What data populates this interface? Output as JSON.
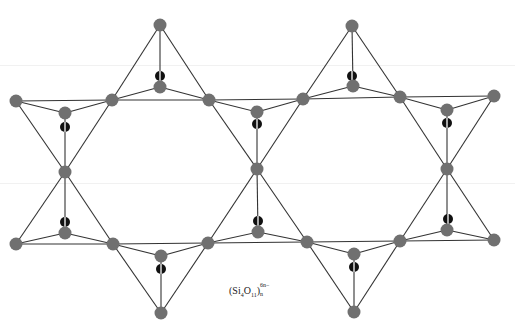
{
  "figure": {
    "caption": {
      "open": "(Si",
      "si_sub": "4",
      "o": "O",
      "o_sub": "11",
      "close": ")",
      "charge_sup": "6n−",
      "n_sub": "n"
    },
    "colors": {
      "oxygen": "#707070",
      "silicon": "#111111",
      "bond": "#333333",
      "background": "#ffffff"
    },
    "atom_radius": {
      "oxygen": 6.5,
      "silicon": 5
    },
    "oxygen_atoms": [
      [
        160,
        25
      ],
      [
        352,
        26
      ],
      [
        16,
        101
      ],
      [
        112,
        100
      ],
      [
        209,
        100
      ],
      [
        303,
        99
      ],
      [
        400,
        97
      ],
      [
        494,
        96
      ],
      [
        65,
        113
      ],
      [
        160,
        87
      ],
      [
        257,
        112
      ],
      [
        353,
        86
      ],
      [
        447,
        110
      ],
      [
        65,
        172
      ],
      [
        257,
        169
      ],
      [
        447,
        169
      ],
      [
        65,
        233
      ],
      [
        258,
        232
      ],
      [
        447,
        230
      ],
      [
        161,
        256
      ],
      [
        354,
        254
      ],
      [
        16,
        244
      ],
      [
        113,
        244
      ],
      [
        208,
        243
      ],
      [
        307,
        242
      ],
      [
        400,
        241
      ],
      [
        494,
        240
      ],
      [
        161,
        313
      ],
      [
        354,
        312
      ]
    ],
    "silicon_atoms": [
      [
        160,
        76
      ],
      [
        352,
        76
      ],
      [
        65,
        127
      ],
      [
        257,
        124
      ],
      [
        447,
        123
      ],
      [
        65,
        222
      ],
      [
        258,
        221
      ],
      [
        448,
        219
      ],
      [
        161,
        269
      ],
      [
        354,
        267
      ]
    ],
    "tetrahedra": [
      {
        "apex": [
          160,
          25
        ],
        "base": [
          [
            112,
            100
          ],
          [
            209,
            100
          ],
          [
            160,
            87
          ]
        ],
        "si": [
          160,
          76
        ]
      },
      {
        "apex": [
          352,
          26
        ],
        "base": [
          [
            303,
            99
          ],
          [
            400,
            97
          ],
          [
            353,
            86
          ]
        ],
        "si": [
          352,
          76
        ]
      },
      {
        "apex": [
          65,
          172
        ],
        "base": [
          [
            16,
            101
          ],
          [
            112,
            100
          ],
          [
            65,
            113
          ]
        ],
        "si": [
          65,
          127
        ]
      },
      {
        "apex": [
          257,
          169
        ],
        "base": [
          [
            209,
            100
          ],
          [
            303,
            99
          ],
          [
            257,
            112
          ]
        ],
        "si": [
          257,
          124
        ]
      },
      {
        "apex": [
          447,
          169
        ],
        "base": [
          [
            400,
            97
          ],
          [
            494,
            96
          ],
          [
            447,
            110
          ]
        ],
        "si": [
          447,
          123
        ]
      },
      {
        "apex": [
          65,
          172
        ],
        "base": [
          [
            16,
            244
          ],
          [
            113,
            244
          ],
          [
            65,
            233
          ]
        ],
        "si": [
          65,
          222
        ]
      },
      {
        "apex": [
          257,
          169
        ],
        "base": [
          [
            208,
            243
          ],
          [
            307,
            242
          ],
          [
            258,
            232
          ]
        ],
        "si": [
          258,
          221
        ]
      },
      {
        "apex": [
          447,
          169
        ],
        "base": [
          [
            400,
            241
          ],
          [
            494,
            240
          ],
          [
            447,
            230
          ]
        ],
        "si": [
          448,
          219
        ]
      },
      {
        "apex": [
          161,
          313
        ],
        "base": [
          [
            113,
            244
          ],
          [
            208,
            243
          ],
          [
            161,
            256
          ]
        ],
        "si": [
          161,
          269
        ]
      },
      {
        "apex": [
          354,
          312
        ],
        "base": [
          [
            307,
            242
          ],
          [
            400,
            241
          ],
          [
            354,
            254
          ]
        ],
        "si": [
          354,
          267
        ]
      }
    ]
  }
}
